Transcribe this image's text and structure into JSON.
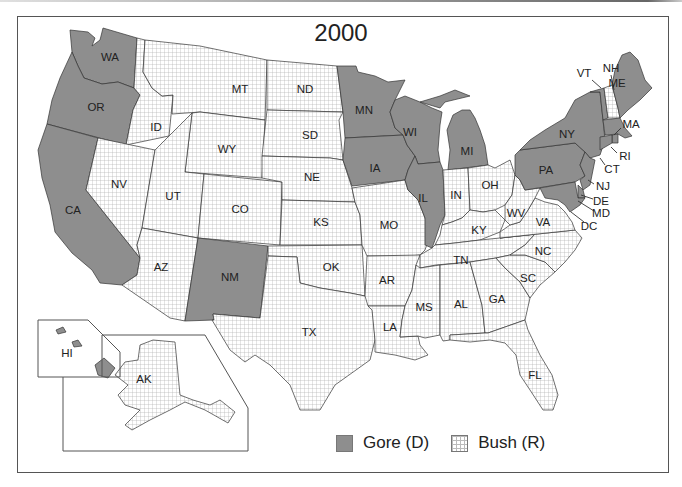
{
  "title": "2000",
  "legend": [
    {
      "key": "gore",
      "label": "Gore (D)",
      "fill": "#8e8e8e"
    },
    {
      "key": "bush",
      "label": "Bush (R)",
      "fill": "grid-hatch"
    }
  ],
  "colors": {
    "gore": "#8e8e8e",
    "bush_bg": "#ffffff",
    "bush_grid": "#b0b0b0",
    "border": "#333333"
  },
  "states": [
    {
      "abbr": "WA",
      "winner": "gore",
      "label_xy": [
        110,
        58
      ]
    },
    {
      "abbr": "OR",
      "winner": "gore",
      "label_xy": [
        96,
        108
      ]
    },
    {
      "abbr": "CA",
      "winner": "gore",
      "label_xy": [
        73,
        211
      ]
    },
    {
      "abbr": "ID",
      "winner": "bush",
      "label_xy": [
        156,
        128
      ]
    },
    {
      "abbr": "NV",
      "winner": "bush",
      "label_xy": [
        119,
        185
      ]
    },
    {
      "abbr": "MT",
      "winner": "bush",
      "label_xy": [
        240,
        90
      ]
    },
    {
      "abbr": "WY",
      "winner": "bush",
      "label_xy": [
        227,
        150
      ]
    },
    {
      "abbr": "UT",
      "winner": "bush",
      "label_xy": [
        173,
        197
      ]
    },
    {
      "abbr": "CO",
      "winner": "bush",
      "label_xy": [
        240,
        210
      ]
    },
    {
      "abbr": "AZ",
      "winner": "bush",
      "label_xy": [
        161,
        268
      ]
    },
    {
      "abbr": "NM",
      "winner": "gore",
      "label_xy": [
        230,
        278
      ]
    },
    {
      "abbr": "ND",
      "winner": "bush",
      "label_xy": [
        305,
        90
      ]
    },
    {
      "abbr": "SD",
      "winner": "bush",
      "label_xy": [
        310,
        136
      ]
    },
    {
      "abbr": "NE",
      "winner": "bush",
      "label_xy": [
        312,
        178
      ]
    },
    {
      "abbr": "KS",
      "winner": "bush",
      "label_xy": [
        321,
        223
      ]
    },
    {
      "abbr": "OK",
      "winner": "bush",
      "label_xy": [
        331,
        268
      ]
    },
    {
      "abbr": "TX",
      "winner": "bush",
      "label_xy": [
        309,
        333
      ]
    },
    {
      "abbr": "MN",
      "winner": "gore",
      "label_xy": [
        364,
        111
      ]
    },
    {
      "abbr": "IA",
      "winner": "gore",
      "label_xy": [
        375,
        169
      ]
    },
    {
      "abbr": "MO",
      "winner": "bush",
      "label_xy": [
        389,
        226
      ]
    },
    {
      "abbr": "AR",
      "winner": "bush",
      "label_xy": [
        387,
        281
      ]
    },
    {
      "abbr": "LA",
      "winner": "bush",
      "label_xy": [
        390,
        328
      ]
    },
    {
      "abbr": "WI",
      "winner": "gore",
      "label_xy": [
        410,
        133
      ]
    },
    {
      "abbr": "IL",
      "winner": "gore",
      "label_xy": [
        423,
        199
      ]
    },
    {
      "abbr": "MI",
      "winner": "gore",
      "label_xy": [
        467,
        152
      ]
    },
    {
      "abbr": "IN",
      "winner": "bush",
      "label_xy": [
        456,
        196
      ]
    },
    {
      "abbr": "OH",
      "winner": "bush",
      "label_xy": [
        490,
        186
      ]
    },
    {
      "abbr": "KY",
      "winner": "bush",
      "label_xy": [
        479,
        231
      ]
    },
    {
      "abbr": "TN",
      "winner": "bush",
      "label_xy": [
        461,
        261
      ]
    },
    {
      "abbr": "MS",
      "winner": "bush",
      "label_xy": [
        424,
        308
      ]
    },
    {
      "abbr": "AL",
      "winner": "bush",
      "label_xy": [
        461,
        305
      ]
    },
    {
      "abbr": "GA",
      "winner": "bush",
      "label_xy": [
        497,
        300
      ]
    },
    {
      "abbr": "FL",
      "winner": "bush",
      "label_xy": [
        535,
        376
      ]
    },
    {
      "abbr": "SC",
      "winner": "bush",
      "label_xy": [
        528,
        279
      ]
    },
    {
      "abbr": "NC",
      "winner": "bush",
      "label_xy": [
        543,
        252
      ]
    },
    {
      "abbr": "VA",
      "winner": "bush",
      "label_xy": [
        543,
        223
      ]
    },
    {
      "abbr": "WV",
      "winner": "bush",
      "label_xy": [
        516,
        214
      ]
    },
    {
      "abbr": "PA",
      "winner": "gore",
      "label_xy": [
        546,
        171
      ]
    },
    {
      "abbr": "NY",
      "winner": "gore",
      "label_xy": [
        567,
        135
      ]
    },
    {
      "abbr": "VT",
      "winner": "gore",
      "label_xy": [
        584,
        74
      ]
    },
    {
      "abbr": "NH",
      "winner": "bush",
      "label_xy": [
        611,
        69
      ]
    },
    {
      "abbr": "ME",
      "winner": "gore",
      "label_xy": [
        617,
        84
      ]
    },
    {
      "abbr": "MA",
      "winner": "gore",
      "label_xy": [
        631,
        125
      ]
    },
    {
      "abbr": "RI",
      "winner": "gore",
      "label_xy": [
        625,
        157
      ]
    },
    {
      "abbr": "CT",
      "winner": "gore",
      "label_xy": [
        612,
        170
      ]
    },
    {
      "abbr": "NJ",
      "winner": "gore",
      "label_xy": [
        603,
        187
      ]
    },
    {
      "abbr": "DE",
      "winner": "gore",
      "label_xy": [
        601,
        202
      ]
    },
    {
      "abbr": "MD",
      "winner": "gore",
      "label_xy": [
        601,
        214
      ]
    },
    {
      "abbr": "DC",
      "winner": "gore",
      "label_xy": [
        589,
        227
      ]
    },
    {
      "abbr": "HI",
      "winner": "gore",
      "label_xy": [
        67,
        354
      ]
    },
    {
      "abbr": "AK",
      "winner": "bush",
      "label_xy": [
        144,
        380
      ]
    }
  ],
  "callouts": [
    {
      "abbr": "VT",
      "line": [
        592,
        80,
        601,
        88
      ]
    },
    {
      "abbr": "NH",
      "line": [
        611,
        75,
        614,
        90
      ]
    },
    {
      "abbr": "MA",
      "line": [
        621,
        128,
        614,
        135
      ]
    },
    {
      "abbr": "RI",
      "line": [
        617,
        153,
        611,
        147
      ]
    },
    {
      "abbr": "CT",
      "line": [
        605,
        165,
        600,
        158
      ]
    },
    {
      "abbr": "NJ",
      "line": [
        594,
        184,
        588,
        180
      ]
    },
    {
      "abbr": "DE",
      "line": [
        593,
        199,
        581,
        195
      ]
    },
    {
      "abbr": "MD",
      "line": [
        594,
        211,
        578,
        201
      ]
    },
    {
      "abbr": "DC",
      "line": [
        584,
        222,
        571,
        212
      ]
    }
  ]
}
